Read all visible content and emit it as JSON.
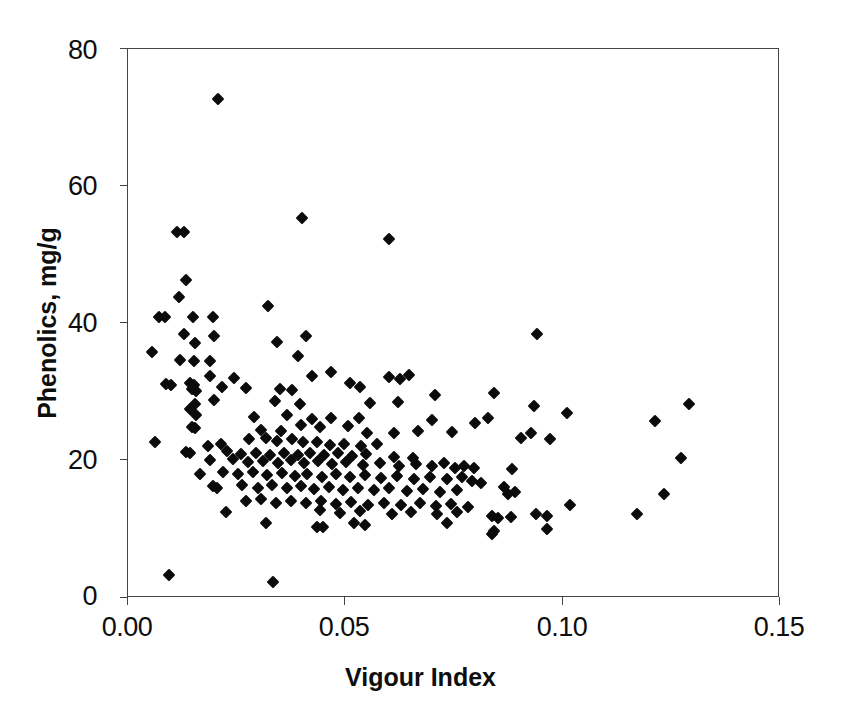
{
  "chart_data": {
    "type": "scatter",
    "title": "",
    "xlabel": "Vigour Index",
    "ylabel": "Phenolics, mg/g",
    "xlim": [
      0.0,
      0.15
    ],
    "ylim": [
      0,
      80
    ],
    "xticks": [
      "0.00",
      "0.05",
      "0.10",
      "0.15"
    ],
    "xtick_values": [
      0.0,
      0.05,
      0.1,
      0.15
    ],
    "yticks": [
      "0",
      "20",
      "40",
      "60",
      "80"
    ],
    "ytick_values": [
      0,
      20,
      40,
      60,
      80
    ],
    "grid": false,
    "legend": "none",
    "marker": "filled-diamond",
    "marker_color": "#0b0b0b",
    "series": [
      {
        "name": "Phenolics vs Vigour Index",
        "points": [
          [
            0.0207,
            72.7
          ],
          [
            0.0112,
            53.3
          ],
          [
            0.0128,
            53.3
          ],
          [
            0.04,
            55.4
          ],
          [
            0.06,
            52.3
          ],
          [
            0.0133,
            46.3
          ],
          [
            0.0118,
            43.9
          ],
          [
            0.0322,
            42.6
          ],
          [
            0.0072,
            41.0
          ],
          [
            0.0084,
            41.0
          ],
          [
            0.015,
            41.0
          ],
          [
            0.0196,
            40.9
          ],
          [
            0.0128,
            38.5
          ],
          [
            0.0197,
            38.2
          ],
          [
            0.0409,
            38.2
          ],
          [
            0.0342,
            37.3
          ],
          [
            0.0154,
            37.2
          ],
          [
            0.094,
            38.4
          ],
          [
            0.0056,
            35.9
          ],
          [
            0.012,
            34.7
          ],
          [
            0.0152,
            34.6
          ],
          [
            0.0188,
            34.6
          ],
          [
            0.0392,
            35.3
          ],
          [
            0.0424,
            32.4
          ],
          [
            0.0466,
            33.0
          ],
          [
            0.0646,
            32.5
          ],
          [
            0.0189,
            32.3
          ],
          [
            0.0244,
            32.1
          ],
          [
            0.0626,
            31.9
          ],
          [
            0.06,
            32.2
          ],
          [
            0.0088,
            31.2
          ],
          [
            0.0099,
            31.1
          ],
          [
            0.0143,
            31.3
          ],
          [
            0.0151,
            31.0
          ],
          [
            0.0147,
            30.4
          ],
          [
            0.0156,
            30.2
          ],
          [
            0.0216,
            30.7
          ],
          [
            0.0272,
            30.6
          ],
          [
            0.0349,
            30.5
          ],
          [
            0.0377,
            30.3
          ],
          [
            0.0511,
            31.3
          ],
          [
            0.0534,
            30.7
          ],
          [
            0.0706,
            29.6
          ],
          [
            0.0841,
            29.8
          ],
          [
            0.0198,
            28.9
          ],
          [
            0.0153,
            28.2
          ],
          [
            0.0142,
            27.5
          ],
          [
            0.0338,
            28.7
          ],
          [
            0.0395,
            28.2
          ],
          [
            0.0556,
            28.4
          ],
          [
            0.0621,
            28.5
          ],
          [
            0.0934,
            28.0
          ],
          [
            0.101,
            27.0
          ],
          [
            0.129,
            28.2
          ],
          [
            0.0156,
            26.6
          ],
          [
            0.029,
            26.4
          ],
          [
            0.0366,
            26.6
          ],
          [
            0.0424,
            26.1
          ],
          [
            0.0467,
            26.3
          ],
          [
            0.0531,
            26.2
          ],
          [
            0.0699,
            25.9
          ],
          [
            0.0798,
            25.5
          ],
          [
            0.0828,
            26.3
          ],
          [
            0.1212,
            25.8
          ],
          [
            0.0148,
            24.9
          ],
          [
            0.0154,
            24.7
          ],
          [
            0.0306,
            24.5
          ],
          [
            0.0352,
            24.4
          ],
          [
            0.0399,
            25.2
          ],
          [
            0.0442,
            24.9
          ],
          [
            0.0505,
            25.0
          ],
          [
            0.055,
            24.1
          ],
          [
            0.0612,
            24.1
          ],
          [
            0.0667,
            24.4
          ],
          [
            0.0745,
            24.2
          ],
          [
            0.0928,
            24.0
          ],
          [
            0.0905,
            23.3
          ],
          [
            0.0971,
            23.1
          ],
          [
            0.0063,
            22.8
          ],
          [
            0.0184,
            22.2
          ],
          [
            0.0215,
            22.4
          ],
          [
            0.0279,
            23.1
          ],
          [
            0.0318,
            23.3
          ],
          [
            0.0342,
            22.9
          ],
          [
            0.0378,
            23.2
          ],
          [
            0.0402,
            22.7
          ],
          [
            0.0434,
            22.8
          ],
          [
            0.0465,
            22.3
          ],
          [
            0.0497,
            22.5
          ],
          [
            0.0535,
            22.1
          ],
          [
            0.0573,
            22.4
          ],
          [
            0.0133,
            21.3
          ],
          [
            0.0143,
            21.1
          ],
          [
            0.0228,
            21.4
          ],
          [
            0.0261,
            21.0
          ],
          [
            0.0295,
            21.2
          ],
          [
            0.0327,
            20.9
          ],
          [
            0.036,
            21.2
          ],
          [
            0.039,
            20.8
          ],
          [
            0.0419,
            21.1
          ],
          [
            0.0451,
            20.8
          ],
          [
            0.0484,
            21.2
          ],
          [
            0.0516,
            20.7
          ],
          [
            0.0548,
            21.0
          ],
          [
            0.0612,
            20.6
          ],
          [
            0.0655,
            20.4
          ],
          [
            0.1272,
            20.4
          ],
          [
            0.0189,
            20.1
          ],
          [
            0.0241,
            20.2
          ],
          [
            0.0276,
            19.8
          ],
          [
            0.0311,
            20.0
          ],
          [
            0.0346,
            19.7
          ],
          [
            0.0374,
            20.1
          ],
          [
            0.0406,
            19.6
          ],
          [
            0.0438,
            19.9
          ],
          [
            0.047,
            19.5
          ],
          [
            0.0502,
            19.8
          ],
          [
            0.054,
            19.4
          ],
          [
            0.0579,
            19.7
          ],
          [
            0.0624,
            19.3
          ],
          [
            0.0663,
            19.5
          ],
          [
            0.07,
            19.2
          ],
          [
            0.0726,
            19.6
          ],
          [
            0.0752,
            19.0
          ],
          [
            0.0773,
            19.3
          ],
          [
            0.0795,
            18.9
          ],
          [
            0.0884,
            18.8
          ],
          [
            0.0165,
            18.1
          ],
          [
            0.0218,
            18.3
          ],
          [
            0.0252,
            18.0
          ],
          [
            0.0288,
            18.4
          ],
          [
            0.032,
            17.9
          ],
          [
            0.0355,
            18.2
          ],
          [
            0.0384,
            17.8
          ],
          [
            0.0412,
            18.1
          ],
          [
            0.0446,
            17.7
          ],
          [
            0.0478,
            18.0
          ],
          [
            0.051,
            17.6
          ],
          [
            0.0545,
            17.9
          ],
          [
            0.0583,
            17.5
          ],
          [
            0.0619,
            17.8
          ],
          [
            0.0658,
            17.4
          ],
          [
            0.0694,
            17.7
          ],
          [
            0.0735,
            17.3
          ],
          [
            0.0768,
            17.6
          ],
          [
            0.0792,
            17.0
          ],
          [
            0.0812,
            16.8
          ],
          [
            0.0866,
            16.2
          ],
          [
            0.0196,
            16.3
          ],
          [
            0.0204,
            16.0
          ],
          [
            0.0263,
            16.4
          ],
          [
            0.0299,
            16.1
          ],
          [
            0.0332,
            16.5
          ],
          [
            0.0366,
            16.0
          ],
          [
            0.0398,
            16.3
          ],
          [
            0.0428,
            15.9
          ],
          [
            0.0462,
            16.2
          ],
          [
            0.0494,
            15.8
          ],
          [
            0.0528,
            16.1
          ],
          [
            0.0565,
            15.7
          ],
          [
            0.06,
            16.0
          ],
          [
            0.0641,
            15.6
          ],
          [
            0.0679,
            15.9
          ],
          [
            0.0718,
            15.4
          ],
          [
            0.0758,
            15.7
          ],
          [
            0.0874,
            15.2
          ],
          [
            0.0891,
            15.4
          ],
          [
            0.1232,
            15.2
          ],
          [
            0.0272,
            14.1
          ],
          [
            0.0306,
            14.4
          ],
          [
            0.034,
            13.9
          ],
          [
            0.0374,
            14.2
          ],
          [
            0.0409,
            13.8
          ],
          [
            0.0443,
            14.1
          ],
          [
            0.0478,
            13.7
          ],
          [
            0.0513,
            14.0
          ],
          [
            0.0553,
            13.6
          ],
          [
            0.0588,
            13.9
          ],
          [
            0.0628,
            13.5
          ],
          [
            0.0672,
            13.8
          ],
          [
            0.0708,
            13.4
          ],
          [
            0.0744,
            13.7
          ],
          [
            0.0783,
            13.2
          ],
          [
            0.1017,
            13.5
          ],
          [
            0.0226,
            12.6
          ],
          [
            0.0442,
            12.8
          ],
          [
            0.0488,
            12.4
          ],
          [
            0.0533,
            12.7
          ],
          [
            0.0608,
            12.3
          ],
          [
            0.065,
            12.6
          ],
          [
            0.0712,
            12.2
          ],
          [
            0.0756,
            12.5
          ],
          [
            0.0838,
            11.9
          ],
          [
            0.0852,
            11.6
          ],
          [
            0.088,
            11.8
          ],
          [
            0.0938,
            12.3
          ],
          [
            0.0965,
            11.9
          ],
          [
            0.1172,
            12.3
          ],
          [
            0.0318,
            11.0
          ],
          [
            0.0434,
            10.4
          ],
          [
            0.0448,
            10.3
          ],
          [
            0.0521,
            10.9
          ],
          [
            0.0545,
            10.7
          ],
          [
            0.0735,
            10.9
          ],
          [
            0.0841,
            9.8
          ],
          [
            0.0964,
            10.0
          ],
          [
            0.0838,
            9.3
          ],
          [
            0.0094,
            3.4
          ],
          [
            0.0333,
            2.3
          ]
        ]
      }
    ]
  },
  "axes": {
    "x": {
      "label": "Vigour Index",
      "tick_labels": [
        "0.00",
        "0.05",
        "0.10",
        "0.15"
      ]
    },
    "y": {
      "label": "Phenolics, mg/g",
      "tick_labels": [
        "0",
        "20",
        "40",
        "60",
        "80"
      ]
    }
  }
}
